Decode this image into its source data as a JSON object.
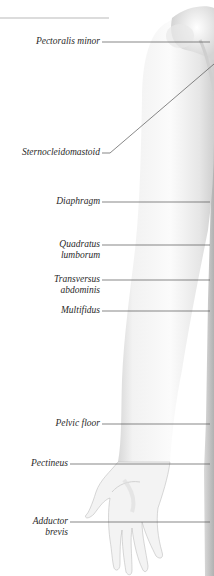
{
  "diagram": {
    "type": "anatomical-illustration",
    "colors": {
      "background": "#ffffff",
      "leader_line": "#555555",
      "label_text": "#2a2a2a",
      "skin_light": "#f4f4f4",
      "skin_shadow": "#c9c9c9",
      "edge_shadow": "#a8a8a8"
    },
    "labels": [
      {
        "id": "pectoralis-minor",
        "line1": "Pectoralis minor",
        "line2": ""
      },
      {
        "id": "sternocleidomastoid",
        "line1": "Sternocleidomastoid",
        "line2": ""
      },
      {
        "id": "diaphragm",
        "line1": "Diaphragm",
        "line2": ""
      },
      {
        "id": "quadratus-lumborum",
        "line1": "Quadratus",
        "line2": "lumborum"
      },
      {
        "id": "transversus-abdominis",
        "line1": "Transversus",
        "line2": "abdominis"
      },
      {
        "id": "multifidus",
        "line1": "Multifidus",
        "line2": ""
      },
      {
        "id": "pelvic-floor",
        "line1": "Pelvic floor",
        "line2": ""
      },
      {
        "id": "pectineus",
        "line1": "Pectineus",
        "line2": ""
      },
      {
        "id": "adductor-brevis",
        "line1": "Adductor",
        "line2": "brevis"
      }
    ]
  }
}
